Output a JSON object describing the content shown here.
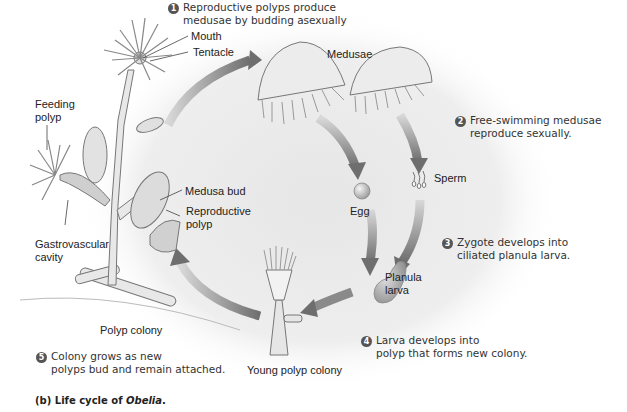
{
  "figure": {
    "caption_prefix": "(b) Life cycle of ",
    "caption_genus": "Obelia",
    "caption_suffix": "."
  },
  "steps": [
    {
      "number": "1",
      "line1": "Reproductive polyps produce",
      "line2": "medusae by budding asexually"
    },
    {
      "number": "2",
      "line1": "Free-swimming medusae",
      "line2": "reproduce sexually."
    },
    {
      "number": "3",
      "line1": "Zygote develops into",
      "line2": "ciliated planula larva."
    },
    {
      "number": "4",
      "line1": "Larva develops into",
      "line2": "polyp that forms new colony."
    },
    {
      "number": "5",
      "line1": "Colony grows as new",
      "line2": "polyps bud and remain attached."
    }
  ],
  "labels": {
    "mouth": "Mouth",
    "tentacle": "Tentacle",
    "feeding_polyp_1": "Feeding",
    "feeding_polyp_2": "polyp",
    "medusa_bud": "Medusa bud",
    "reproductive_polyp_1": "Reproductive",
    "reproductive_polyp_2": "polyp",
    "gastrovascular_1": "Gastrovascular",
    "gastrovascular_2": "cavity",
    "polyp_colony": "Polyp colony",
    "medusae": "Medusae",
    "egg": "Egg",
    "sperm": "Sperm",
    "planula_1": "Planula",
    "planula_2": "larva",
    "young_polyp_colony": "Young polyp colony"
  },
  "colors": {
    "arrow": "#7a7a7a",
    "background_glow": "#ececec",
    "step_badge": "#555555"
  }
}
